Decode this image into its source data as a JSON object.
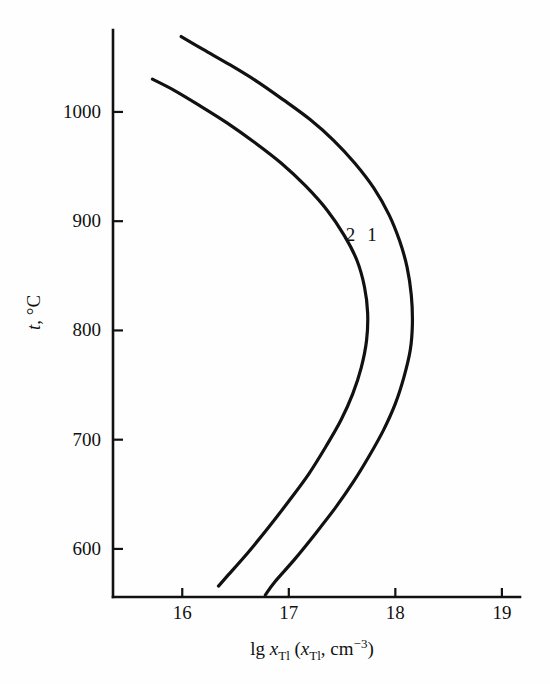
{
  "chart_data": {
    "type": "line",
    "title": "",
    "xlabel": "lg xTl (xTl, cm-3)",
    "xlabel_parts": {
      "lg": "lg ",
      "x1": "x",
      "sub1": "Tl",
      "open": " (",
      "x2": "x",
      "sub2": "Tl",
      "comma": ", cm",
      "sup": "-3",
      "close": ")"
    },
    "ylabel": "t, °C",
    "ylabel_parts": {
      "symbol": "t",
      "rest": ", °C"
    },
    "xlim": [
      15.35,
      19.17
    ],
    "ylim": [
      556,
      1075
    ],
    "grid": false,
    "legend_position": "inline-curve-labels",
    "xticks": [
      16,
      17,
      18,
      19
    ],
    "xtick_labels": [
      "16",
      "17",
      "18",
      "19"
    ],
    "yticks": [
      600,
      700,
      800,
      900,
      1000
    ],
    "ytick_labels": [
      "600",
      "700",
      "800",
      "900",
      "1000"
    ],
    "series": [
      {
        "name": "1",
        "label": "1",
        "label_x": 17.78,
        "label_y": 882,
        "points": [
          [
            15.99,
            1069
          ],
          [
            16.2,
            1057
          ],
          [
            16.45,
            1043
          ],
          [
            16.7,
            1028
          ],
          [
            16.95,
            1011
          ],
          [
            17.2,
            993
          ],
          [
            17.42,
            974
          ],
          [
            17.62,
            953
          ],
          [
            17.8,
            930
          ],
          [
            17.94,
            906
          ],
          [
            18.04,
            882
          ],
          [
            18.11,
            858
          ],
          [
            18.15,
            832
          ],
          [
            18.16,
            806
          ],
          [
            18.14,
            782
          ],
          [
            18.08,
            757
          ],
          [
            18.0,
            733
          ],
          [
            17.89,
            709
          ],
          [
            17.76,
            686
          ],
          [
            17.61,
            662
          ],
          [
            17.44,
            638
          ],
          [
            17.25,
            614
          ],
          [
            17.05,
            590
          ],
          [
            16.87,
            570
          ],
          [
            16.78,
            558
          ]
        ]
      },
      {
        "name": "2",
        "label": "2",
        "label_x": 17.58,
        "label_y": 882,
        "points": [
          [
            15.72,
            1030
          ],
          [
            15.92,
            1020
          ],
          [
            16.16,
            1006
          ],
          [
            16.42,
            990
          ],
          [
            16.68,
            972
          ],
          [
            16.93,
            953
          ],
          [
            17.16,
            932
          ],
          [
            17.36,
            910
          ],
          [
            17.52,
            887
          ],
          [
            17.64,
            864
          ],
          [
            17.71,
            840
          ],
          [
            17.74,
            816
          ],
          [
            17.73,
            791
          ],
          [
            17.68,
            766
          ],
          [
            17.6,
            742
          ],
          [
            17.49,
            718
          ],
          [
            17.35,
            694
          ],
          [
            17.19,
            669
          ],
          [
            17.01,
            645
          ],
          [
            16.82,
            621
          ],
          [
            16.62,
            597
          ],
          [
            16.43,
            576
          ],
          [
            16.34,
            566
          ]
        ]
      }
    ]
  }
}
